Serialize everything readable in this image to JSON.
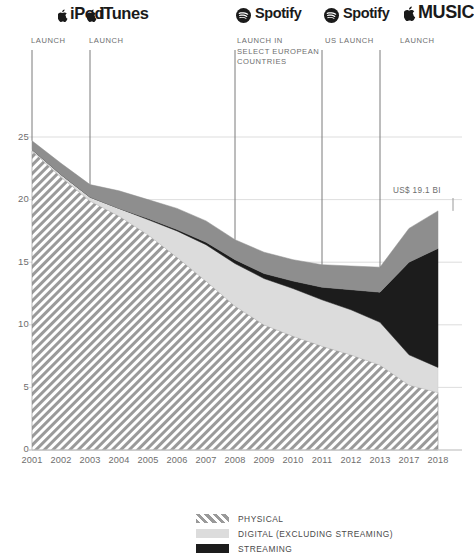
{
  "annotations": {
    "brands": [
      {
        "id": "ipod",
        "icon": "apple-logo-icon",
        "name": "iPod",
        "label": "LAUNCH"
      },
      {
        "id": "itunes",
        "icon": "apple-logo-icon",
        "name": "iTunes",
        "label": "LAUNCH"
      },
      {
        "id": "spotify-eu",
        "icon": "spotify-logo-icon",
        "name": "Spotify",
        "label": "LAUNCH IN\nSELECT EUROPEAN\nCOUNTRIES"
      },
      {
        "id": "spotify-us",
        "icon": "spotify-logo-icon",
        "name": "Spotify",
        "label": "US LAUNCH"
      },
      {
        "id": "apple-music",
        "icon": "apple-logo-icon",
        "name": "MUSIC",
        "label": "LAUNCH"
      }
    ],
    "value_callout": "US$ 19.1 BI"
  },
  "legend": {
    "items": [
      {
        "label": "PHYSICAL",
        "fill": "hatch",
        "color": "#9a9a9a"
      },
      {
        "label": "DIGITAL (EXCLUDING STREAMING)",
        "fill": "solid",
        "color": "#d8d8d8"
      },
      {
        "label": "STREAMING",
        "fill": "solid",
        "color": "#1c1c1c"
      }
    ]
  },
  "chart_data": {
    "type": "area",
    "stacked": true,
    "title": "",
    "xlabel": "",
    "ylabel": "",
    "ylim": [
      0,
      25
    ],
    "yticks": [
      0,
      5,
      10,
      15,
      20,
      25
    ],
    "grid": true,
    "categories": [
      "2001",
      "2002",
      "2003",
      "2004",
      "2005",
      "2006",
      "2007",
      "2008",
      "2009",
      "2010",
      "2011",
      "2012",
      "2013",
      "2017",
      "2018"
    ],
    "series": [
      {
        "name": "PHYSICAL",
        "color": "#9a9a9a",
        "pattern": "diagonal-hatch",
        "values": [
          23.9,
          21.8,
          19.9,
          18.7,
          17.2,
          15.4,
          13.5,
          11.5,
          10.0,
          9.1,
          8.3,
          7.6,
          6.8,
          5.2,
          4.6
        ]
      },
      {
        "name": "DIGITAL (EXCLUDING STREAMING)",
        "color": "#d8d8d8",
        "pattern": "solid",
        "values": [
          0.1,
          0.2,
          0.3,
          0.6,
          1.2,
          2.1,
          2.9,
          3.4,
          3.7,
          3.8,
          3.7,
          3.6,
          3.4,
          2.4,
          2.0
        ]
      },
      {
        "name": "STREAMING",
        "color": "#1c1c1c",
        "pattern": "solid",
        "values": [
          0.0,
          0.0,
          0.0,
          0.0,
          0.1,
          0.1,
          0.2,
          0.3,
          0.4,
          0.6,
          1.0,
          1.6,
          2.4,
          7.4,
          9.5
        ]
      },
      {
        "name": "OTHER",
        "color": "#8e8e8e",
        "pattern": "solid",
        "values": [
          0.7,
          0.9,
          1.0,
          1.4,
          1.5,
          1.7,
          1.7,
          1.6,
          1.7,
          1.7,
          1.8,
          1.9,
          2.0,
          2.7,
          3.0
        ]
      }
    ],
    "totals": [
      24.7,
      22.9,
      21.2,
      20.7,
      20.0,
      19.3,
      18.3,
      16.8,
      15.8,
      15.2,
      14.8,
      14.7,
      14.6,
      17.7,
      19.1
    ],
    "annotation_years": [
      "2001",
      "2003",
      "2008",
      "2011",
      "2013"
    ],
    "final_value_label": "US$ 19.1 BI"
  }
}
